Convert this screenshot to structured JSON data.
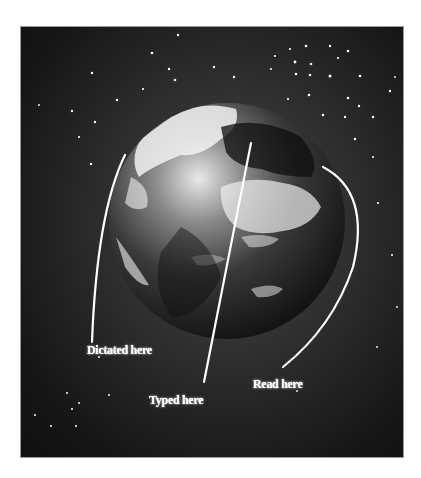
{
  "figure": {
    "background_color": "#1a1a1a",
    "labels": [
      {
        "id": "dictated",
        "text": "Dictated here"
      },
      {
        "id": "typed",
        "text": "Typed here"
      },
      {
        "id": "read",
        "text": "Read here"
      }
    ]
  }
}
